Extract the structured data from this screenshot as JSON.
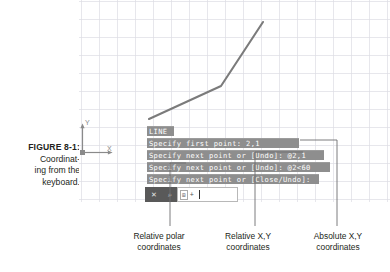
{
  "figure": {
    "caption_label": "FIGURE 8-1:",
    "caption_line1": "Coordinat-",
    "caption_line2": "ing from the",
    "caption_line3": "keyboard."
  },
  "drawing": {
    "ucs_x_label": "X",
    "ucs_y_label": "Y",
    "grid_color": "#dcdce4",
    "line_color": "#7b7b7b",
    "polyline_points": [
      [
        70,
        119
      ],
      [
        142,
        86
      ],
      [
        184,
        22
      ]
    ]
  },
  "command_lines": [
    {
      "text": "LINE"
    },
    {
      "text": "Specify first point: 2,1"
    },
    {
      "text": "Specify next point or [Undo]: @2,1"
    },
    {
      "text": "Specify next point or [Undo]: @2<60"
    },
    {
      "text": "Specify next point or [Close/Undo]:"
    }
  ],
  "dynamic_input": {
    "close_icon": "✕",
    "tool_icon": "⌕",
    "chip": "⊞",
    "plus": "+",
    "value": "",
    "placeholder": ""
  },
  "callouts": [
    {
      "line1": "Relative polar",
      "line2": "coordinates"
    },
    {
      "line1": "Relative X,Y",
      "line2": "coordinates"
    },
    {
      "line1": "Absolute X,Y",
      "line2": "coordinates"
    }
  ],
  "colors": {
    "command_bg": "#8e8e8e",
    "command_fg": "#ffffff",
    "text": "#231f20",
    "leader": "#6d6e71"
  }
}
